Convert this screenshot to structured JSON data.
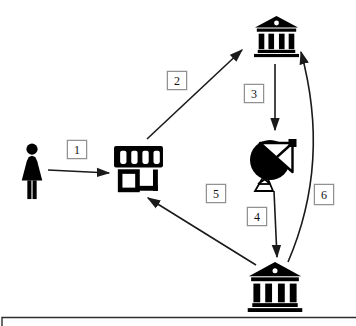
{
  "diagram": {
    "colors": {
      "background": "#ffffff",
      "line": "#1a1a1a",
      "icon": "#000000",
      "label_box_border": "#919191",
      "label_text": "#111111"
    },
    "nodes": [
      {
        "id": "customer",
        "icon": "person-woman-icon"
      },
      {
        "id": "store",
        "icon": "storefront-icon"
      },
      {
        "id": "bank-top",
        "icon": "bank-icon"
      },
      {
        "id": "satellite-dish",
        "icon": "satellite-dish-icon"
      },
      {
        "id": "bank-bottom",
        "icon": "bank-icon"
      }
    ],
    "edges": [
      {
        "label": "1",
        "from": "customer",
        "to": "store",
        "style": "straight"
      },
      {
        "label": "2",
        "from": "store",
        "to": "bank-top",
        "style": "straight"
      },
      {
        "label": "3",
        "from": "bank-top",
        "to": "satellite-dish",
        "style": "straight"
      },
      {
        "label": "4",
        "from": "satellite-dish",
        "to": "bank-bottom",
        "style": "straight"
      },
      {
        "label": "5",
        "from": "bank-bottom",
        "to": "store",
        "style": "straight"
      },
      {
        "label": "6",
        "from": "bank-bottom",
        "to": "bank-top",
        "style": "curved"
      }
    ]
  }
}
